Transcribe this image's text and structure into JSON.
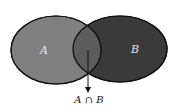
{
  "diagram": {
    "type": "venn",
    "sets": [
      {
        "name": "A",
        "label": "A",
        "fill": "#7f7f7f"
      },
      {
        "name": "B",
        "label": "B",
        "fill": "#3a3a3a"
      }
    ],
    "intersection": {
      "label": "A ∩ B",
      "fill": "#5e5e5e"
    },
    "outline_color": "#111111"
  }
}
